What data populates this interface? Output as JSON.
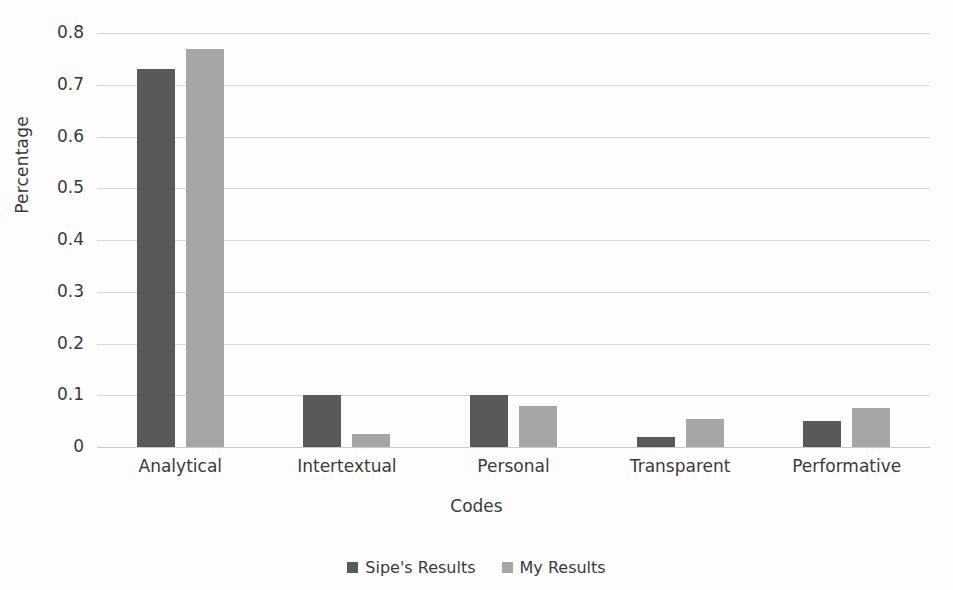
{
  "chart_data": {
    "type": "bar",
    "title": "",
    "xlabel": "Codes",
    "ylabel": "Percentage",
    "categories": [
      "Analytical",
      "Intertextual",
      "Personal",
      "Transparent",
      "Performative"
    ],
    "series": [
      {
        "name": "Sipe's Results",
        "color": "#58595B",
        "values": [
          0.73,
          0.1,
          0.1,
          0.02,
          0.05
        ]
      },
      {
        "name": "My Results",
        "color": "#A6A6A6",
        "values": [
          0.77,
          0.025,
          0.08,
          0.055,
          0.075
        ]
      }
    ],
    "ylim": [
      0,
      0.8
    ],
    "ytick_labels": [
      "0.8",
      "0.7",
      "0.6",
      "0.5",
      "0.4",
      "0.3",
      "0.2",
      "0.1",
      "0"
    ],
    "ytick_values": [
      0.8,
      0.7,
      0.6,
      0.5,
      0.4,
      0.3,
      0.2,
      0.1,
      0
    ],
    "grid": true,
    "legend_position": "bottom"
  },
  "legend": {
    "items": [
      {
        "label": "Sipe's Results",
        "marker": "square-swatch-dark"
      },
      {
        "label": "My Results",
        "marker": "square-swatch-light"
      }
    ]
  },
  "colors": {
    "series_dark": "#58595B",
    "series_light": "#A6A6A6",
    "gridline": "#D7D7D7",
    "text": "#3A3A3A",
    "background": "#FDFDFD"
  }
}
